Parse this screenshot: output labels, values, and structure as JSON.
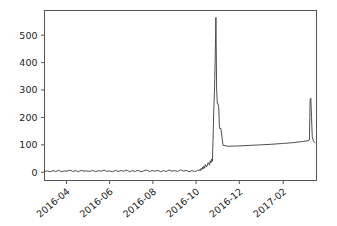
{
  "figure": {
    "background_color": "#ffffff",
    "border_color": "#eceef0"
  },
  "chart_data": {
    "type": "line",
    "title": "",
    "xlabel": "",
    "ylabel": "",
    "grid": false,
    "legend": null,
    "line_color": "#3b3b3b",
    "line_width": 0.9,
    "axes_color": "#555555",
    "xlim": [
      "2016-03-01",
      "2017-03-20"
    ],
    "ylim": [
      -30,
      590
    ],
    "yticks": [
      0,
      100,
      200,
      300,
      400,
      500
    ],
    "ytick_labels": [
      "0",
      "100",
      "200",
      "300",
      "400",
      "500"
    ],
    "xticks": [
      "2016-04",
      "2016-06",
      "2016-08",
      "2016-10",
      "2016-12",
      "2017-02"
    ],
    "xtick_labels": [
      "2016-04",
      "2016-06",
      "2016-08",
      "2016-10",
      "2017-02",
      "2017-02"
    ],
    "xtick_label_rotation": -40,
    "series": [
      {
        "name": "value",
        "description": "Flat noisy baseline near zero from March to late September 2016, a short zigzag rise to about 40 in early October, a sharp spike peaking near 565 in late October, a step-down plateau near 95-110 through winter, and a final narrow spike to about 270 at the right edge.",
        "x": [
          "2016-03-01",
          "2016-03-05",
          "2016-03-09",
          "2016-03-13",
          "2016-03-17",
          "2016-03-21",
          "2016-03-25",
          "2016-03-29",
          "2016-04-02",
          "2016-04-06",
          "2016-04-10",
          "2016-04-14",
          "2016-04-18",
          "2016-04-22",
          "2016-04-26",
          "2016-04-30",
          "2016-05-04",
          "2016-05-08",
          "2016-05-12",
          "2016-05-16",
          "2016-05-20",
          "2016-05-24",
          "2016-05-28",
          "2016-06-01",
          "2016-06-05",
          "2016-06-09",
          "2016-06-13",
          "2016-06-17",
          "2016-06-21",
          "2016-06-25",
          "2016-06-29",
          "2016-07-03",
          "2016-07-07",
          "2016-07-11",
          "2016-07-15",
          "2016-07-19",
          "2016-07-23",
          "2016-07-27",
          "2016-07-31",
          "2016-08-04",
          "2016-08-08",
          "2016-08-12",
          "2016-08-16",
          "2016-08-20",
          "2016-08-24",
          "2016-08-28",
          "2016-09-01",
          "2016-09-05",
          "2016-09-09",
          "2016-09-13",
          "2016-09-17",
          "2016-09-21",
          "2016-09-25",
          "2016-09-29",
          "2016-10-01",
          "2016-10-03",
          "2016-10-05",
          "2016-10-06",
          "2016-10-07",
          "2016-10-08",
          "2016-10-09",
          "2016-10-10",
          "2016-10-11",
          "2016-10-12",
          "2016-10-13",
          "2016-10-14",
          "2016-10-16",
          "2016-10-18",
          "2016-10-20",
          "2016-10-21",
          "2016-10-22",
          "2016-10-23",
          "2016-10-24",
          "2016-10-25",
          "2016-10-26",
          "2016-10-27",
          "2016-10-28",
          "2016-10-29",
          "2016-10-30",
          "2016-10-31",
          "2016-11-01",
          "2016-11-02",
          "2016-11-03",
          "2016-11-05",
          "2016-11-08",
          "2016-11-15",
          "2016-11-30",
          "2016-12-15",
          "2016-12-31",
          "2017-01-15",
          "2017-01-31",
          "2017-02-15",
          "2017-02-28",
          "2017-03-08",
          "2017-03-10",
          "2017-03-11",
          "2017-03-12",
          "2017-03-13",
          "2017-03-14",
          "2017-03-16",
          "2017-03-18"
        ],
        "values": [
          3,
          5,
          2,
          6,
          3,
          7,
          2,
          5,
          4,
          8,
          3,
          6,
          2,
          7,
          4,
          5,
          3,
          7,
          2,
          6,
          4,
          8,
          3,
          5,
          2,
          7,
          3,
          6,
          4,
          8,
          2,
          6,
          3,
          7,
          2,
          5,
          8,
          3,
          6,
          4,
          7,
          2,
          6,
          3,
          8,
          4,
          6,
          3,
          9,
          4,
          7,
          2,
          6,
          3,
          4,
          8,
          5,
          10,
          6,
          14,
          9,
          18,
          12,
          22,
          15,
          28,
          20,
          35,
          26,
          42,
          34,
          48,
          40,
          125,
          230,
          300,
          420,
          565,
          300,
          250,
          250,
          235,
          160,
          160,
          98,
          95,
          96,
          98,
          100,
          102,
          105,
          108,
          112,
          115,
          118,
          265,
          270,
          200,
          130,
          112,
          108
        ]
      }
    ],
    "annotations": [
      {
        "label": "major-spike-peak",
        "value": 565,
        "x": "2016-10-29"
      },
      {
        "label": "plateau-level",
        "value": 95,
        "x": "2016-11-15"
      },
      {
        "label": "final-spike-peak",
        "value": 270,
        "x": "2017-03-12"
      }
    ]
  }
}
